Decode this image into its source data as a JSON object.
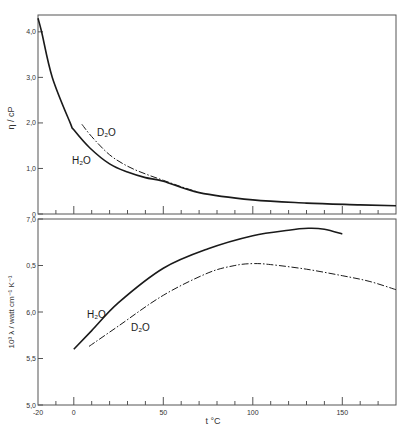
{
  "chart_data": [
    {
      "type": "line",
      "panel": "top",
      "title": "",
      "xlabel": "",
      "ylabel": "η / cP",
      "xlim": [
        -20,
        180
      ],
      "ylim": [
        0,
        4.37
      ],
      "yticks": [
        0,
        1.0,
        2.0,
        3.0,
        4.0
      ],
      "ytick_labels": [
        "0",
        "1,0",
        "2,0",
        "3,0",
        "4,0"
      ],
      "xticks_minor_step": 10,
      "xticks_major": [
        0,
        50,
        100,
        150
      ],
      "grid": false,
      "legend": "inline labels",
      "series": [
        {
          "name": "H₂O",
          "style": "solid",
          "x": [
            -20,
            -18,
            -12,
            -2,
            0,
            9,
            20,
            30,
            40,
            50,
            70,
            100,
            130,
            160,
            180
          ],
          "y": [
            4.3,
            4.0,
            3.0,
            2.0,
            1.85,
            1.45,
            1.1,
            0.92,
            0.8,
            0.72,
            0.47,
            0.31,
            0.24,
            0.2,
            0.18
          ]
        },
        {
          "name": "D₂O",
          "style": "dash-dot",
          "x": [
            4.5,
            10,
            20,
            30,
            40,
            50,
            60,
            68
          ],
          "y": [
            1.97,
            1.7,
            1.3,
            1.05,
            0.88,
            0.74,
            0.6,
            0.5
          ]
        }
      ],
      "annotations": [
        {
          "text": "D₂O",
          "x": 12,
          "y": 1.7
        },
        {
          "text": "H₂O",
          "x": -2,
          "y": 1.2
        }
      ]
    },
    {
      "type": "line",
      "panel": "bottom",
      "title": "",
      "xlabel": "t °C",
      "ylabel": "10³ λ / watt cm⁻¹ K⁻¹",
      "xlim": [
        -20,
        180
      ],
      "ylim": [
        5.0,
        7.0
      ],
      "yticks": [
        5.0,
        5.5,
        6.0,
        6.5,
        7.0
      ],
      "ytick_labels": [
        "5,0",
        "5,5",
        "6,0",
        "0,5",
        "7,0"
      ],
      "xticks_major": [
        -20,
        0,
        50,
        100,
        150
      ],
      "xtick_labels": [
        "-20",
        "0",
        "50",
        "100",
        "150"
      ],
      "xticks_minor_step": 10,
      "grid": false,
      "legend": "inline labels",
      "series": [
        {
          "name": "H₂O",
          "style": "solid",
          "x": [
            0,
            10,
            25,
            50,
            75,
            100,
            120,
            131,
            140,
            150
          ],
          "y": [
            5.6,
            5.8,
            6.1,
            6.47,
            6.68,
            6.82,
            6.88,
            6.9,
            6.89,
            6.84
          ]
        },
        {
          "name": "D₂O",
          "style": "dash-dot",
          "x": [
            8.5,
            25,
            50,
            75,
            90,
            100,
            110,
            130,
            150,
            165,
            180
          ],
          "y": [
            5.63,
            5.85,
            6.18,
            6.42,
            6.5,
            6.52,
            6.51,
            6.46,
            6.39,
            6.33,
            6.24
          ]
        }
      ],
      "annotations": [
        {
          "text": "H₂O",
          "x": 4,
          "y": 6.02
        },
        {
          "text": "D₂O",
          "x": 21,
          "y": 5.88
        }
      ]
    }
  ],
  "labels": {
    "top_ylabel": "η / cP",
    "bottom_ylabel": "10³ λ / watt cm⁻¹ K⁻¹",
    "xlabel": "t °C",
    "top_h2o": "H₂O",
    "top_d2o": "D₂O",
    "bottom_h2o": "H₂O",
    "bottom_d2o": "D₂O"
  }
}
